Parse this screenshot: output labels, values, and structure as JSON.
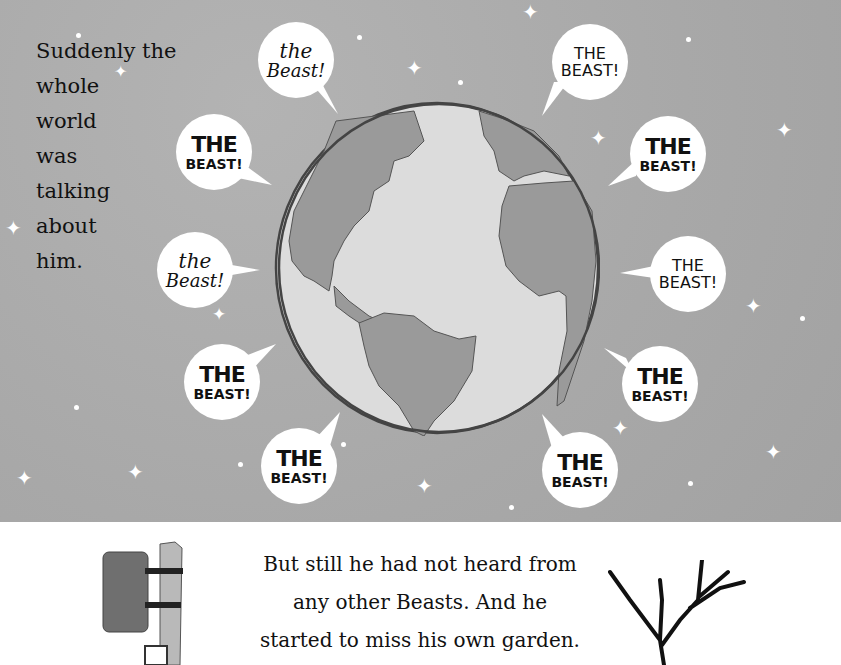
{
  "page": {
    "intro_text": [
      "Suddenly the",
      "whole",
      "world",
      "was",
      "talking",
      "about",
      "him."
    ],
    "caption_text": [
      "But still he had not heard from",
      "any other Beasts. And he",
      "started to miss his own garden."
    ]
  },
  "bubbles": [
    {
      "line1": "the",
      "line2": "Beast!",
      "style": "script"
    },
    {
      "line1": "THE",
      "line2": "BEAST!",
      "style": "plain"
    },
    {
      "line1": "THE",
      "line2": "BEAST!",
      "style": "bold"
    },
    {
      "line1": "THE",
      "line2": "BEAST!",
      "style": "bold"
    },
    {
      "line1": "the",
      "line2": "Beast!",
      "style": "script"
    },
    {
      "line1": "THE",
      "line2": "BEAST!",
      "style": "plain"
    },
    {
      "line1": "THE",
      "line2": "BEAST!",
      "style": "bold"
    },
    {
      "line1": "THE",
      "line2": "BEAST!",
      "style": "bold"
    },
    {
      "line1": "THE",
      "line2": "BEAST!",
      "style": "bold"
    },
    {
      "line1": "THE",
      "line2": "BEAST!",
      "style": "bold"
    }
  ],
  "colors": {
    "sky": "#a9a9a9",
    "ocean": "#dcdcdc",
    "land": "#9a9a9a",
    "ink": "#111111"
  }
}
